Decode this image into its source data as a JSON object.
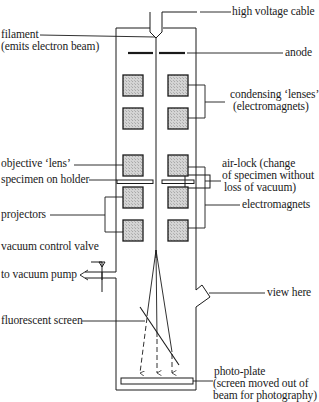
{
  "diagram": {
    "labels": {
      "high_voltage_cable": "high voltage cable",
      "filament_line1": "filament",
      "filament_line2": "(emits electron beam)",
      "anode": "anode",
      "condensing_line1": "condensing ‘lenses’",
      "condensing_line2": "(electromagnets)",
      "specimen_on_holder": "specimen on holder",
      "airlock_line1": "air-lock (change",
      "airlock_line2": "of specimen without",
      "airlock_line3": "loss of vacuum)",
      "objective_lens": "objective ‘lens’",
      "electromagnets": "electromagnets",
      "projectors": "projectors",
      "vacuum_control_valve": "vacuum control valve",
      "to_vacuum_pump": "to vacuum pump",
      "view_here": "view here",
      "fluorescent_screen": "fluorescent screen",
      "photoplate_line1": "photo-plate",
      "photoplate_line2": "(screen moved out of",
      "photoplate_line3": "beam for photography)"
    },
    "colors": {
      "line": "#1a1a1a",
      "magnet_fill": "#c8c8c8",
      "background": "#ffffff"
    }
  }
}
